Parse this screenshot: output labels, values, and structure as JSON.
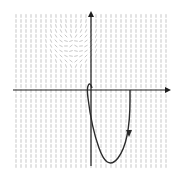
{
  "diagram": {
    "type": "slope-field-with-solution-curve",
    "colors": {
      "background": "#ffffff",
      "axis": "#1e1e1e",
      "field": "#b9b9b9",
      "curve": "#2a2a2a"
    },
    "axes": {
      "origin_px": [
        91,
        90
      ],
      "x_axis": {
        "from_px": [
          13,
          90
        ],
        "to_px": [
          171,
          90
        ],
        "arrow": "right"
      },
      "y_axis": {
        "from_px": [
          91,
          166
        ],
        "to_px": [
          91,
          11
        ],
        "arrow": "up"
      }
    },
    "field_grid": {
      "x_start": 16,
      "x_end": 166,
      "y_start": 16,
      "y_end": 166,
      "spacing": 5
    },
    "solution_curve": {
      "path": "M 130 90 L 130 100 C 130 120, 128 145, 118 158 C 110 168, 104 162, 99 148 C 94 134, 90 115, 88 98 C 86 84, 90 80, 92 88",
      "arrow_at_px": [
        129,
        133
      ],
      "arrow_direction": "down"
    }
  }
}
